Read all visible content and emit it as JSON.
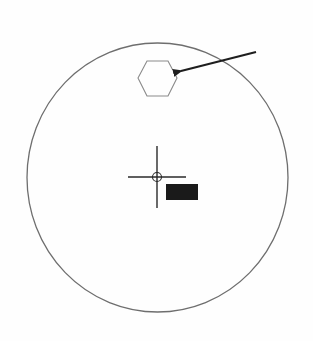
{
  "diagram": {
    "colors": {
      "background": "#fefefe",
      "circle_stroke": "#6e6e6e",
      "hexagon_stroke": "#8a8a8a",
      "arrow": "#1e1e1e",
      "crosshair": "#2a2a2a",
      "label_box": "#1a1a1a"
    },
    "elements": [
      {
        "name": "outer-circle",
        "shape": "ellipse",
        "cx": 157.5,
        "cy": 177.5,
        "rx": 130.5,
        "ry": 134.5
      },
      {
        "name": "hexagon-target",
        "shape": "hexagon",
        "points": "138,78 147,61 168,61 177,78 168,96 147,96"
      },
      {
        "name": "arrow",
        "shape": "arrow",
        "from": [
          256,
          52
        ],
        "to": [
          181,
          71
        ]
      },
      {
        "name": "crosshair",
        "shape": "crosshair",
        "cx": 157,
        "cy": 177,
        "half_h": 29,
        "half_v": 31,
        "ring_r": 4.5
      },
      {
        "name": "label-box",
        "shape": "rect",
        "x": 166,
        "y": 184,
        "w": 32,
        "h": 16
      }
    ]
  }
}
